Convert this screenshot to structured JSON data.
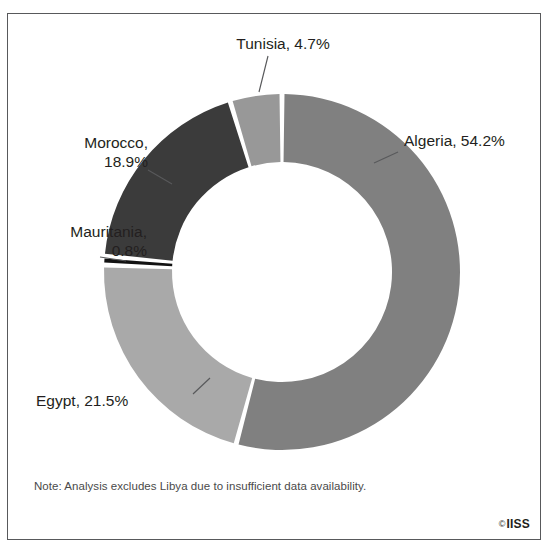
{
  "title": "Defence budgets in the Maghreb",
  "footnote": "Note: Analysis excludes Libya due to insufficient data availability.",
  "credit": {
    "mark": "©",
    "text": "IISS"
  },
  "labels": {
    "tunisia": "Tunisia, 4.7%",
    "algeria": "Algeria, 54.2%",
    "morocco": "Morocco,\n18.9%",
    "mauritania": "Mauritania,\n0.8%",
    "egypt": "Egypt, 21.5%"
  },
  "chart_data": {
    "type": "pie",
    "variant": "donut",
    "title": "Defence budgets in the Maghreb",
    "categories": [
      "Algeria",
      "Egypt",
      "Mauritania",
      "Morocco",
      "Tunisia"
    ],
    "values": [
      54.2,
      21.5,
      0.8,
      18.9,
      4.7
    ],
    "units": "%",
    "labels": [
      "Algeria, 54.2%",
      "Egypt, 21.5%",
      "Mauritania, 0.8%",
      "Morocco, 18.9%",
      "Tunisia, 4.7%"
    ],
    "colors": [
      "#808080",
      "#a9a9a9",
      "#121212",
      "#3b3b3b",
      "#989898"
    ],
    "start_angle_deg": 0,
    "direction": "clockwise",
    "inner_radius_ratio": 0.62,
    "legend": "none",
    "labels_position": "outside-with-leader-lines",
    "grid": false,
    "note": "Note: Analysis excludes Libya due to insufficient data availability.",
    "source": "IISS"
  },
  "geometry": {
    "cx": 282,
    "cy": 272,
    "outer_r": 178,
    "inner_r": 110,
    "gap_deg": 1.6
  }
}
